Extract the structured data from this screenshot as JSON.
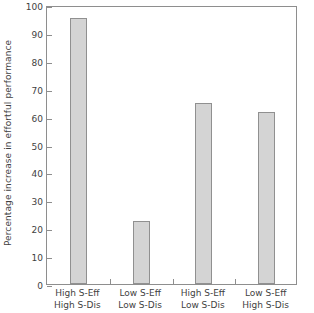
{
  "chart_data": {
    "type": "bar",
    "title": "",
    "xlabel": "",
    "ylabel": "Percentage increase in effortful performance",
    "ylim": [
      0,
      100
    ],
    "yticks": [
      0,
      10,
      20,
      30,
      40,
      50,
      60,
      70,
      80,
      90,
      100
    ],
    "ytick_labels": [
      "0",
      "10",
      "20",
      "30",
      "40",
      "50",
      "60",
      "70",
      "80",
      "90",
      "100"
    ],
    "grid": false,
    "legend": null,
    "frame": "full-box",
    "tick_direction": "in",
    "categories": [
      "High S-Eff High S-Dis",
      "Low S-Eff Low S-Dis",
      "High S-Eff Low S-Dis",
      "Low S-Eff High S-Dis"
    ],
    "category_lines": [
      [
        "High S-Eff",
        "High S-Dis"
      ],
      [
        "Low S-Eff",
        "Low S-Dis"
      ],
      [
        "High S-Eff",
        "Low S-Dis"
      ],
      [
        "Low S-Eff",
        "High S-Dis"
      ]
    ],
    "values": [
      95.3,
      22.5,
      64.8,
      61.5
    ],
    "bar_fill": "#d4d4d4",
    "bar_edge": "#909090",
    "axis_color": "#8e8e8e",
    "text_color": "#3f3f3f",
    "background": "#ffffff"
  }
}
